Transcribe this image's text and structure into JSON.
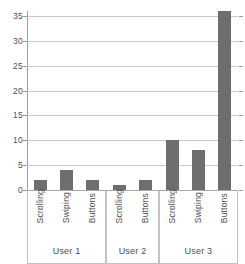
{
  "chart_data": {
    "type": "bar",
    "title": "",
    "subtitle": "",
    "xlabel": "",
    "ylabel": "",
    "ylim": [
      0,
      36
    ],
    "y_ticks": [
      0,
      5,
      10,
      15,
      20,
      25,
      30,
      35
    ],
    "grid": true,
    "legend": "none",
    "bar_color": "#6e6e6e",
    "grid_color": "#c9c9c9",
    "axis_color": "#9f9f9f",
    "groups": [
      {
        "name": "User 1",
        "categories": [
          "Scrolling",
          "Swiping",
          "Buttons"
        ],
        "values": [
          2,
          4,
          2
        ]
      },
      {
        "name": "User 2",
        "categories": [
          "Scrolling",
          "Buttons"
        ],
        "values": [
          1,
          2
        ]
      },
      {
        "name": "User 3",
        "categories": [
          "Scrolling",
          "Swiping",
          "Buttons"
        ],
        "values": [
          10,
          8,
          36
        ]
      }
    ],
    "categories": [
      "Scrolling",
      "Swiping",
      "Buttons",
      "Scrolling",
      "Buttons",
      "Scrolling",
      "Swiping",
      "Buttons"
    ],
    "values": [
      2,
      4,
      2,
      1,
      2,
      10,
      8,
      36
    ]
  },
  "axis": {
    "y_tick_labels": [
      "0",
      "5",
      "10",
      "15",
      "20",
      "25",
      "30",
      "35"
    ]
  },
  "bars": [
    {
      "label": "Scrolling",
      "group": "User 1",
      "value": 2
    },
    {
      "label": "Swiping",
      "group": "User 1",
      "value": 4
    },
    {
      "label": "Buttons",
      "group": "User 1",
      "value": 2
    },
    {
      "label": "Scrolling",
      "group": "User 2",
      "value": 1
    },
    {
      "label": "Buttons",
      "group": "User 2",
      "value": 2
    },
    {
      "label": "Scrolling",
      "group": "User 3",
      "value": 10
    },
    {
      "label": "Swiping",
      "group": "User 3",
      "value": 8
    },
    {
      "label": "Buttons",
      "group": "User 3",
      "value": 36
    }
  ],
  "groups": [
    {
      "name": "User 1"
    },
    {
      "name": "User 2"
    },
    {
      "name": "User 3"
    }
  ]
}
